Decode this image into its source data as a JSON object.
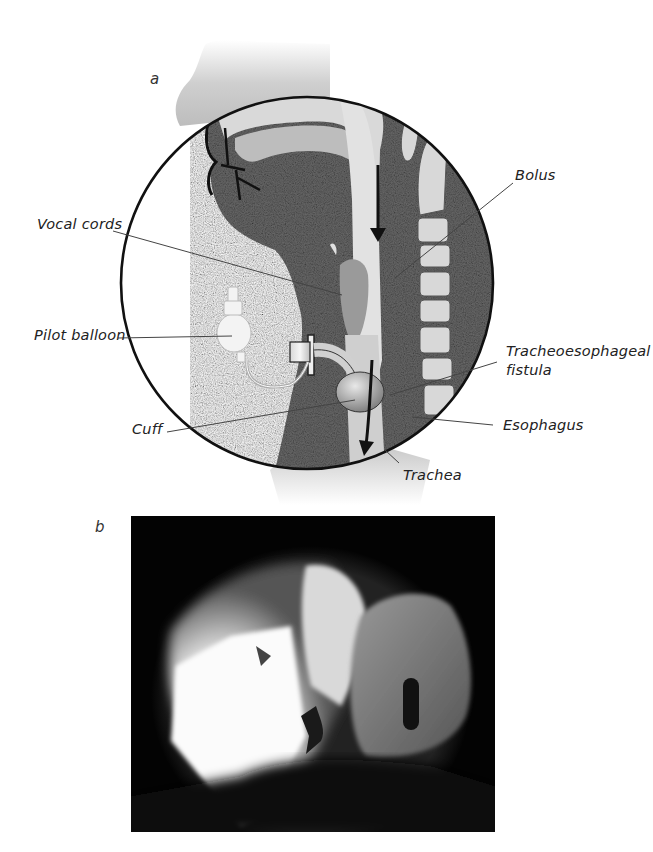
{
  "figure": {
    "panel_a": {
      "letter": "a",
      "description": "Sagittal illustration of head and neck with tracheostomy tube showing bolus passing through tracheoesophageal fistula",
      "labels": {
        "vocal_cords": "Vocal cords",
        "pilot_balloon": "Pilot balloon",
        "cuff": "Cuff",
        "bolus": "Bolus",
        "fistula_line1": "Tracheoesophageal",
        "fistula_line2": "fistula",
        "esophagus": "Esophagus",
        "trachea": "Trachea"
      }
    },
    "panel_b": {
      "letter": "b",
      "description": "Fluoroscopic radiograph image"
    },
    "colors": {
      "tissue": "#6a6a6a",
      "outline": "#111111",
      "background": "#ffffff",
      "photo_bg": "#030303"
    }
  }
}
